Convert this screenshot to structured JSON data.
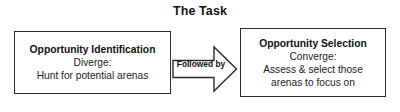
{
  "title": "The Task",
  "boxes": {
    "left": {
      "heading": "Opportunity Identification",
      "line1": "Diverge:",
      "line2": "Hunt for potential arenas"
    },
    "right": {
      "heading": "Opportunity Selection",
      "line1": "Converge:",
      "line2": "Assess & select those",
      "line3": "arenas to focus on"
    }
  },
  "arrow": {
    "label": "Followed by",
    "icon": "right-block-arrow-icon",
    "stroke_color": "#2b2b2b",
    "fill_color": "#ffffff"
  },
  "colors": {
    "background": "#ffffff",
    "text": "#1a1a1a",
    "border": "#2b2b2b"
  }
}
